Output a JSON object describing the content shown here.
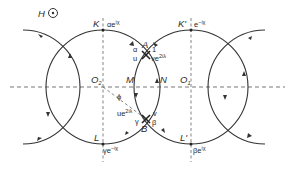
{
  "field_label": {
    "symbol": "H",
    "icon": "out-of-page-field-icon"
  },
  "centers": {
    "left": "O",
    "left_sub": "2",
    "right": "O",
    "right_sub": "1"
  },
  "points": {
    "K": "K",
    "K_val": "αe",
    "K_exp": "iχ",
    "K_prime": "K'",
    "K_prime_val": "e",
    "K_prime_exp": "−iχ",
    "L": "L",
    "L_val": "γe",
    "L_exp": "−iχ",
    "L_prime": "L'",
    "L_prime_val": "βe",
    "L_prime_exp": "iχ",
    "M": "M",
    "N": "N",
    "A": "A",
    "B": "B"
  },
  "junction_A": {
    "alpha": "α",
    "u": "u",
    "one": "1",
    "v_val": "ve",
    "v_exp": "2iλ"
  },
  "junction_B": {
    "u_val": "ue",
    "u_exp": "2iλ",
    "gamma": "γ",
    "v": "v",
    "beta": "β"
  },
  "angle": "ϕ"
}
